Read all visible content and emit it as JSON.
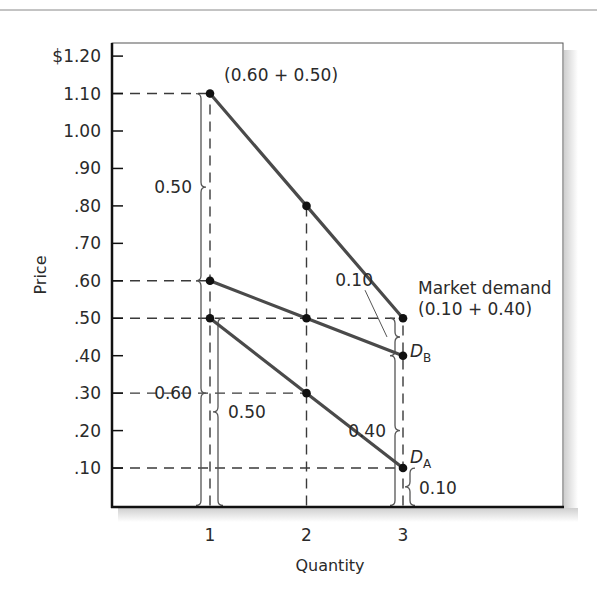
{
  "chart_data": {
    "type": "line",
    "title": "",
    "xlabel": "Quantity",
    "ylabel": "Price",
    "xlim": [
      0,
      4
    ],
    "ylim": [
      0,
      1.2
    ],
    "x_ticks": [
      1,
      2,
      3
    ],
    "x_tick_labels": [
      "1",
      "2",
      "3"
    ],
    "y_ticks": [
      0.1,
      0.2,
      0.3,
      0.4,
      0.5,
      0.6,
      0.7,
      0.8,
      0.9,
      1.0,
      1.1,
      1.2
    ],
    "y_tick_labels": [
      ".10",
      ".20",
      ".30",
      ".40",
      ".50",
      ".60",
      ".70",
      ".80",
      ".90",
      "1.00",
      "1.10",
      "$1.20"
    ],
    "grid": false,
    "series": [
      {
        "name": "Market demand",
        "x": [
          1,
          2,
          3
        ],
        "values": [
          1.1,
          0.8,
          0.5
        ]
      },
      {
        "name": "D_B",
        "x": [
          1,
          2,
          3
        ],
        "values": [
          0.6,
          0.5,
          0.4
        ]
      },
      {
        "name": "D_A",
        "x": [
          1,
          2,
          3
        ],
        "values": [
          0.5,
          0.3,
          0.1
        ]
      }
    ],
    "guide_lines": {
      "horizontal": [
        {
          "y": 1.1,
          "to_x": 1
        },
        {
          "y": 0.6,
          "to_x": 1
        },
        {
          "y": 0.5,
          "to_x": 3
        },
        {
          "y": 0.3,
          "to_x": 2
        },
        {
          "y": 0.1,
          "to_x": 3
        }
      ],
      "vertical": [
        {
          "x": 1,
          "to_y": 1.1
        },
        {
          "x": 2,
          "to_y": 0.8
        },
        {
          "x": 3,
          "to_y": 0.5
        }
      ]
    },
    "annotations": [
      {
        "text": "(0.60 + 0.50)",
        "at": "above market demand point at quantity 1"
      },
      {
        "text": "Market demand",
        "at": "right of market demand point at quantity 3"
      },
      {
        "text": "(0.10 + 0.40)",
        "at": "below 'Market demand' label"
      },
      {
        "text": "0.50",
        "brace": "left",
        "x": 1,
        "from": 0.6,
        "to": 1.1
      },
      {
        "text": "0.60",
        "brace": "left",
        "x": 1,
        "from": 0.0,
        "to": 0.6
      },
      {
        "text": "0.50",
        "brace": "right",
        "x": 1,
        "from": 0.0,
        "to": 0.5
      },
      {
        "text": "0.10",
        "brace": "left",
        "x": 3,
        "from": 0.4,
        "to": 0.5,
        "leader": true
      },
      {
        "text": "0.40",
        "brace": "left",
        "x": 3,
        "from": 0.0,
        "to": 0.4
      },
      {
        "text": "0.10",
        "brace": "right",
        "x": 3,
        "from": 0.0,
        "to": 0.1
      }
    ],
    "curve_labels": [
      {
        "text": "D",
        "sub": "B",
        "series": "D_B"
      },
      {
        "text": "D",
        "sub": "A",
        "series": "D_A"
      }
    ],
    "colors": {
      "line": "#4a4a4a",
      "point": "#111111",
      "dash": "#3a3a3a",
      "brace": "#555555",
      "frame": "#111111",
      "shadow": "#d8d8d8"
    }
  }
}
